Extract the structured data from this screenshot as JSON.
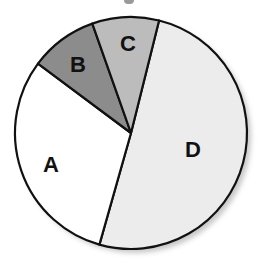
{
  "chart_data": {
    "type": "pie",
    "title": "",
    "start_angle_deg": 14,
    "direction": "clockwise",
    "slices": [
      {
        "label": "D",
        "value": 50.5,
        "color": "#ececec",
        "label_pos": [
          193,
          149
        ]
      },
      {
        "label": "A",
        "value": 30.8,
        "color": "#ffffff",
        "label_pos": [
          51,
          164
        ]
      },
      {
        "label": "B",
        "value": 9.4,
        "color": "#8c8c8c",
        "label_pos": [
          78,
          64
        ]
      },
      {
        "label": "C",
        "value": 9.3,
        "color": "#bcbcbc",
        "label_pos": [
          128,
          43
        ]
      }
    ],
    "categories": [
      "A",
      "B",
      "C",
      "D"
    ],
    "values": [
      30.8,
      9.4,
      9.3,
      50.5
    ],
    "legend": "none (labels drawn inside slices)",
    "has_shadow": true
  },
  "geometry": {
    "cx": 131,
    "cy": 133,
    "r": 116
  }
}
